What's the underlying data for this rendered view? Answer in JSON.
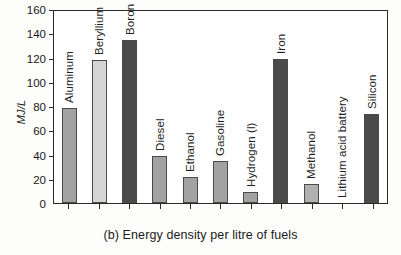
{
  "chart_data": {
    "type": "bar",
    "title": "",
    "caption": "(b) Energy density per litre of fuels",
    "xlabel": "",
    "ylabel": "MJ/L",
    "ylim": [
      0,
      160
    ],
    "yticks": [
      0,
      20,
      40,
      60,
      80,
      100,
      120,
      140,
      160
    ],
    "grid": false,
    "legend": "none",
    "categories": [
      "Aluminum",
      "Beryllium",
      "Boron",
      "Diesel",
      "Ethanol",
      "Gasoline",
      "Hydrogen (l)",
      "Iron",
      "Methanol",
      "Lithium acid battery",
      "Silicon"
    ],
    "values": [
      79,
      119,
      136,
      39,
      22,
      35,
      9,
      120,
      16,
      0,
      74
    ],
    "bar_colors": [
      "#a2a2a2",
      "#d5d5d5",
      "#4a4a4a",
      "#a2a2a2",
      "#a2a2a2",
      "#a2a2a2",
      "#a2a2a2",
      "#4a4a4a",
      "#b0b0b0",
      "#ffffff",
      "#4a4a4a"
    ]
  },
  "axis": {
    "frame_color": "#2a2a2a"
  }
}
